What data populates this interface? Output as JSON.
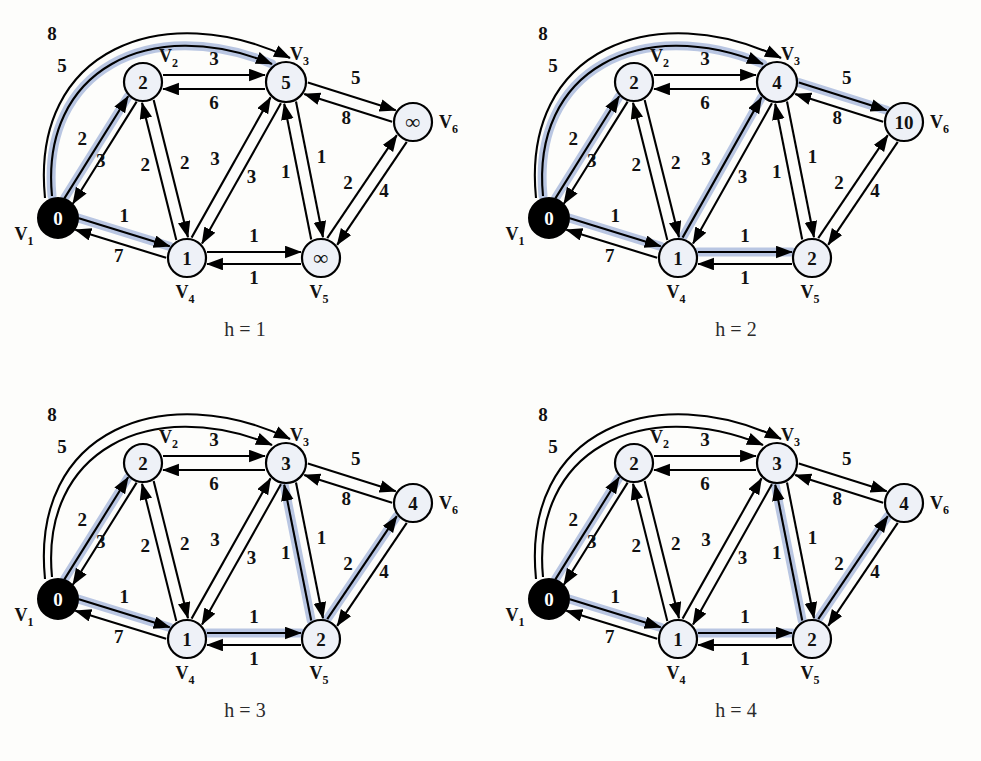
{
  "figure": {
    "title": "",
    "background": "#fdfdfb",
    "highlight_color": "#b9c6e2",
    "node_fill": "#eef1f7",
    "node_source_fill": "#000000",
    "edge_color": "#000000"
  },
  "graph": {
    "vertex_labels": [
      "V",
      "V",
      "V",
      "V",
      "V",
      "V"
    ],
    "vertex_subscripts": [
      "1",
      "2",
      "3",
      "4",
      "5",
      "6"
    ],
    "vertex_names": [
      "V1",
      "V2",
      "V3",
      "V4",
      "V5",
      "V6"
    ],
    "edge_weights": {
      "v1_v3_arc": "8",
      "v3_v1_arc": "5",
      "v1_v2": "2",
      "v2_v1": "3",
      "v2_v3": "3",
      "v3_v2": "6",
      "v2_v4": "2",
      "v4_v2": "2",
      "v1_v4": "1",
      "v4_v1": "7",
      "v4_v3": "3",
      "v3_v4": "3",
      "v3_v5": "1",
      "v5_v3": "1",
      "v4_v5": "1",
      "v5_v4": "1",
      "v3_v6": "5",
      "v6_v3": "8",
      "v5_v6": "2",
      "v6_v5": "4"
    }
  },
  "panels": [
    {
      "id": "panel-h1",
      "caption": "h = 1",
      "node_values": [
        "0",
        "2",
        "5",
        "1",
        "∞",
        "∞"
      ],
      "highlighted_edges": [
        "v1_v3_arc",
        "v1_v2",
        "v1_v4"
      ]
    },
    {
      "id": "panel-h2",
      "caption": "h = 2",
      "node_values": [
        "0",
        "2",
        "4",
        "1",
        "2",
        "10"
      ],
      "highlighted_edges": [
        "v1_v3_arc",
        "v1_v2",
        "v1_v4",
        "v4_v3",
        "v4_v5",
        "v3_v6"
      ]
    },
    {
      "id": "panel-h3",
      "caption": "h = 3",
      "node_values": [
        "0",
        "2",
        "3",
        "1",
        "2",
        "4"
      ],
      "highlighted_edges": [
        "v1_v2",
        "v1_v4",
        "v4_v5",
        "v5_v3",
        "v5_v6"
      ]
    },
    {
      "id": "panel-h4",
      "caption": "h = 4",
      "node_values": [
        "0",
        "2",
        "3",
        "1",
        "2",
        "4"
      ],
      "highlighted_edges": [
        "v1_v2",
        "v1_v4",
        "v4_v5",
        "v5_v3",
        "v5_v6"
      ]
    }
  ],
  "chart_data": {
    "type": "diagram",
    "subtype": "directed-weighted-graph-bellman-ford-iterations",
    "vertices": [
      "V1",
      "V2",
      "V3",
      "V4",
      "V5",
      "V6"
    ],
    "directed_edges": [
      {
        "from": "V1",
        "to": "V3",
        "weight": 8,
        "style": "arc"
      },
      {
        "from": "V3",
        "to": "V1",
        "weight": 5,
        "style": "arc"
      },
      {
        "from": "V1",
        "to": "V2",
        "weight": 2
      },
      {
        "from": "V2",
        "to": "V1",
        "weight": 3
      },
      {
        "from": "V2",
        "to": "V3",
        "weight": 3
      },
      {
        "from": "V3",
        "to": "V2",
        "weight": 6
      },
      {
        "from": "V2",
        "to": "V4",
        "weight": 2
      },
      {
        "from": "V4",
        "to": "V2",
        "weight": 2
      },
      {
        "from": "V1",
        "to": "V4",
        "weight": 1
      },
      {
        "from": "V4",
        "to": "V1",
        "weight": 7
      },
      {
        "from": "V4",
        "to": "V3",
        "weight": 3
      },
      {
        "from": "V3",
        "to": "V4",
        "weight": 3
      },
      {
        "from": "V3",
        "to": "V5",
        "weight": 1
      },
      {
        "from": "V5",
        "to": "V3",
        "weight": 1
      },
      {
        "from": "V4",
        "to": "V5",
        "weight": 1
      },
      {
        "from": "V5",
        "to": "V4",
        "weight": 1
      },
      {
        "from": "V3",
        "to": "V6",
        "weight": 5
      },
      {
        "from": "V6",
        "to": "V3",
        "weight": 8
      },
      {
        "from": "V5",
        "to": "V6",
        "weight": 2
      },
      {
        "from": "V6",
        "to": "V5",
        "weight": 4
      }
    ],
    "iterations": [
      {
        "h": 1,
        "labels": {
          "V1": "0",
          "V2": "2",
          "V3": "5",
          "V4": "1",
          "V5": "∞",
          "V6": "∞"
        }
      },
      {
        "h": 2,
        "labels": {
          "V1": "0",
          "V2": "2",
          "V3": "4",
          "V4": "1",
          "V5": "2",
          "V6": "10"
        }
      },
      {
        "h": 3,
        "labels": {
          "V1": "0",
          "V2": "2",
          "V3": "3",
          "V4": "1",
          "V5": "2",
          "V6": "4"
        }
      },
      {
        "h": 4,
        "labels": {
          "V1": "0",
          "V2": "2",
          "V3": "3",
          "V4": "1",
          "V5": "2",
          "V6": "4"
        }
      }
    ],
    "source_vertex": "V1",
    "title": "",
    "legend": []
  }
}
